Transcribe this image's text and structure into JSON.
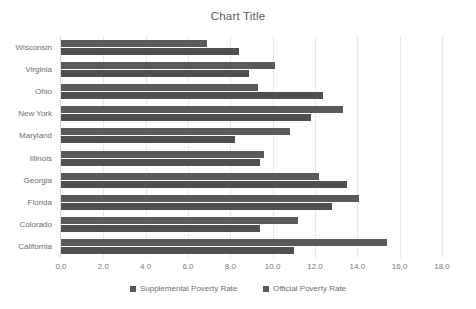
{
  "chart_data": {
    "type": "bar",
    "title": "Chart Title",
    "orientation": "horizontal",
    "xlabel": "",
    "ylabel": "",
    "xlim": [
      0,
      18
    ],
    "xticks": [
      "0.0",
      "2.0",
      "4.0",
      "6.0",
      "8.0",
      "10.0",
      "12.0",
      "14.0",
      "16.0",
      "18.0"
    ],
    "xtick_values": [
      0,
      2,
      4,
      6,
      8,
      10,
      12,
      14,
      16,
      18
    ],
    "grid": true,
    "legend_position": "bottom",
    "categories": [
      "Wisconsin",
      "Virginia",
      "Ohio",
      "New York",
      "Maryland",
      "Illinois",
      "Georgia",
      "Florida",
      "Colorado",
      "California"
    ],
    "series": [
      {
        "name": "Official Poverty Rate",
        "color": "#5a5a5a",
        "values": [
          6.9,
          10.1,
          9.3,
          13.3,
          10.8,
          9.6,
          12.2,
          14.1,
          11.2,
          15.4
        ]
      },
      {
        "name": "Supplemental Poverty Rate",
        "color": "#4f4f4f",
        "values": [
          8.4,
          8.9,
          12.4,
          11.8,
          8.2,
          9.4,
          13.5,
          12.8,
          9.4,
          11.0
        ]
      }
    ],
    "legend": [
      "Supplemental Poverty Rate",
      "Official Poverty Rate"
    ]
  },
  "colors": {
    "bar": "#595959",
    "gridline": "#e8e8e8",
    "text": "#6e6e6e",
    "background": "#ffffff"
  }
}
